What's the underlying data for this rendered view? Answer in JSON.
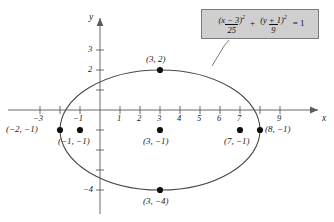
{
  "figure": {
    "axes": {
      "x_name": "x",
      "y_name": "y",
      "x_ticks": [
        {
          "value": -3,
          "label": "−3",
          "px": 40
        },
        {
          "value": -2,
          "label": "",
          "px": 60
        },
        {
          "value": -1,
          "label": "−1",
          "px": 80
        },
        {
          "value": 1,
          "label": "1",
          "px": 120
        },
        {
          "value": 2,
          "label": "2",
          "px": 140
        },
        {
          "value": 3,
          "label": "3",
          "px": 160
        },
        {
          "value": 4,
          "label": "4",
          "px": 180
        },
        {
          "value": 5,
          "label": "5",
          "px": 200
        },
        {
          "value": 6,
          "label": "6",
          "px": 220
        },
        {
          "value": 7,
          "label": "7",
          "px": 240
        },
        {
          "value": 8,
          "label": "",
          "px": 260
        },
        {
          "value": 9,
          "label": "9",
          "px": 280
        }
      ],
      "y_ticks": [
        {
          "value": 3,
          "label": "3",
          "px": 50
        },
        {
          "value": 2,
          "label": "2",
          "px": 70
        },
        {
          "value": 1,
          "label": "",
          "px": 90
        },
        {
          "value": -1,
          "label": "",
          "px": 130
        },
        {
          "value": -2,
          "label": "",
          "px": 150
        },
        {
          "value": -3,
          "label": "",
          "px": 170
        },
        {
          "value": -4,
          "label": "−4",
          "px": 190
        }
      ],
      "origin_px": {
        "x": 100,
        "y": 110
      },
      "unit_px": 20,
      "x_range": [
        -3.6,
        10.2
      ],
      "y_range": [
        -5.1,
        4.3
      ]
    },
    "curve": {
      "type": "ellipse",
      "center": [
        3,
        -1
      ],
      "semi_major_x": 5,
      "semi_minor_y": 3,
      "stroke": "#4a4a4a"
    },
    "points": [
      {
        "coords": "(−2, −1)",
        "x": -2,
        "y": -1,
        "label_pos": "left"
      },
      {
        "coords": "(−1, −1)",
        "x": -1,
        "y": -1,
        "label_pos": "below"
      },
      {
        "coords": "(3, 2)",
        "x": 3,
        "y": 2,
        "label_pos": "above"
      },
      {
        "coords": "(3, −1)",
        "x": 3,
        "y": -1,
        "label_pos": "below"
      },
      {
        "coords": "(3, −4)",
        "x": 3,
        "y": -4,
        "label_pos": "below"
      },
      {
        "coords": "(7, −1)",
        "x": 7,
        "y": -1,
        "label_pos": "below"
      },
      {
        "coords": "(8, −1)",
        "x": 8,
        "y": -1,
        "label_pos": "right"
      }
    ],
    "equation": {
      "num1": "(x − 3)",
      "num1_sup": "2",
      "den1": "25",
      "plus": "+",
      "num2": "(y + 1)",
      "num2_sup": "2",
      "den2": "9",
      "equals": "= 1"
    },
    "colors": {
      "box_fill": "#cfcfcf",
      "box_border": "#7d7d7d",
      "axis": "#5a5a5a",
      "curve": "#4a4a4a",
      "point": "#111111",
      "background": "#ffffff"
    }
  }
}
